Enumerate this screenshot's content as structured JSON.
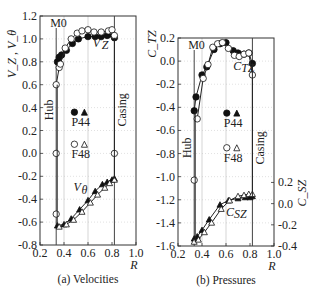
{
  "chart_data": [
    {
      "id": "a",
      "type": "line",
      "caption": "(a) Velocities",
      "xlabel": "R",
      "ylabel": "V_Z , V_θ",
      "xlim": [
        0.2,
        1.0
      ],
      "ylim": [
        -0.8,
        1.2
      ],
      "xticks": [
        "0.2",
        "0.4",
        "0.6",
        "0.8",
        "1.0"
      ],
      "yticks": [
        "-0.8",
        "-0.6",
        "-0.4",
        "-0.2",
        "0.0",
        "0.2",
        "0.4",
        "0.6",
        "0.8",
        "1.0",
        "1.2"
      ],
      "hub_R": 0.335,
      "casing_R": 0.82,
      "grid_x": [
        0.4,
        0.6
      ],
      "annotations": {
        "mode": "M0",
        "hub": "Hub",
        "casing": "Casing",
        "vz_label": "V",
        "vz_sub": "Z",
        "vt_label": "V",
        "vt_sub": "θ"
      },
      "legend": [
        {
          "label": "P44",
          "markers": [
            "filled-circle",
            "filled-triangle"
          ]
        },
        {
          "label": "F48",
          "markers": [
            "open-circle",
            "open-triangle"
          ]
        }
      ],
      "series": [
        {
          "name": "P44 V_Z",
          "marker": "filled-circle",
          "x": [
            0.345,
            0.36,
            0.38,
            0.42,
            0.47,
            0.52,
            0.6,
            0.66,
            0.71,
            0.76,
            0.8,
            0.82
          ],
          "y": [
            0.8,
            0.84,
            0.86,
            0.9,
            0.96,
            1.0,
            1.02,
            1.02,
            1.02,
            1.03,
            1.04,
            1.01
          ]
        },
        {
          "name": "F48 V_Z",
          "marker": "open-circle",
          "x": [
            0.335,
            0.36,
            0.37,
            0.41,
            0.46,
            0.51,
            0.55,
            0.6,
            0.65,
            0.71,
            0.77,
            0.8,
            0.82
          ],
          "y": [
            0.6,
            0.75,
            0.78,
            0.92,
            1.0,
            1.05,
            1.07,
            1.08,
            1.06,
            1.06,
            1.07,
            1.08,
            1.03
          ]
        },
        {
          "name": "F48 V_Z hub/casing",
          "marker": "open-circle",
          "x": [
            0.335,
            0.335,
            0.82
          ],
          "y": [
            0.0,
            -0.53,
            0.0
          ]
        },
        {
          "name": "P44 V_θ",
          "marker": "filled-triangle",
          "x": [
            0.345,
            0.4,
            0.46,
            0.53,
            0.6,
            0.66,
            0.72,
            0.76,
            0.8,
            0.82
          ],
          "y": [
            -0.63,
            -0.62,
            -0.57,
            -0.49,
            -0.41,
            -0.33,
            -0.27,
            -0.25,
            -0.23,
            -0.22
          ]
        },
        {
          "name": "F48 V_θ",
          "marker": "open-triangle",
          "x": [
            0.36,
            0.42,
            0.48,
            0.55,
            0.62,
            0.68,
            0.74,
            0.78,
            0.82
          ],
          "y": [
            -0.64,
            -0.62,
            -0.58,
            -0.51,
            -0.43,
            -0.36,
            -0.3,
            -0.26,
            -0.23
          ]
        }
      ]
    },
    {
      "id": "b",
      "type": "line",
      "caption": "(b) Pressures",
      "xlabel": "R",
      "ylabel": "C_TZ",
      "ylabel_right": "C_SZ",
      "xlim": [
        0.2,
        1.0
      ],
      "ylim": [
        -1.6,
        0.2
      ],
      "ylim_right": [
        -0.4,
        0.2
      ],
      "xticks": [
        "0.2",
        "0.4",
        "0.6",
        "0.8",
        "1.0"
      ],
      "yticks": [
        "-1.6",
        "-1.4",
        "-1.2",
        "-1.0",
        "-0.8",
        "-0.6",
        "-0.4",
        "-0.2",
        "0.0",
        "0.2"
      ],
      "yticks_right": [
        "-0.4",
        "-0.2",
        "0.0",
        "0.2"
      ],
      "hub_R": 0.335,
      "casing_R": 0.82,
      "grid_x": [
        0.4,
        0.6
      ],
      "annotations": {
        "mode": "M0",
        "hub": "Hub",
        "casing": "Casing",
        "ctz_label": "C",
        "ctz_sub": "TZ",
        "csz_label": "C",
        "csz_sub": "SZ"
      },
      "legend": [
        {
          "label": "P44",
          "markers": [
            "filled-circle",
            "filled-triangle"
          ]
        },
        {
          "label": "F48",
          "markers": [
            "open-circle",
            "open-triangle"
          ]
        }
      ],
      "series": [
        {
          "name": "P44 C_TZ",
          "marker": "filled-circle",
          "x": [
            0.335,
            0.35,
            0.4,
            0.44,
            0.5,
            0.55,
            0.6,
            0.66,
            0.7,
            0.75,
            0.79,
            0.82
          ],
          "y": [
            -0.43,
            -0.31,
            -0.12,
            -0.05,
            0.1,
            0.15,
            0.16,
            0.09,
            0.07,
            0.06,
            0.07,
            -0.02
          ]
        },
        {
          "name": "F48 C_TZ",
          "marker": "open-circle",
          "x": [
            0.36,
            0.41,
            0.45,
            0.49,
            0.53,
            0.57,
            0.62,
            0.67,
            0.71,
            0.75,
            0.79,
            0.82
          ],
          "y": [
            -0.5,
            -0.15,
            -0.03,
            0.12,
            0.15,
            0.16,
            0.11,
            0.05,
            0.04,
            0.06,
            0.07,
            -0.12
          ]
        },
        {
          "name": "F48 C_TZ hub",
          "marker": "open-circle",
          "x": [
            0.335
          ],
          "y": [
            -1.03
          ]
        },
        {
          "name": "P44 C_SZ",
          "marker": "filled-triangle",
          "x": [
            0.335,
            0.36,
            0.4,
            0.46,
            0.55,
            0.62,
            0.7,
            0.76,
            0.8,
            0.82
          ],
          "y": [
            -0.33,
            -0.31,
            -0.25,
            -0.15,
            -0.01,
            0.03,
            0.05,
            0.06,
            0.06,
            0.07
          ]
        },
        {
          "name": "F48 C_SZ",
          "marker": "open-triangle",
          "x": [
            0.335,
            0.37,
            0.42,
            0.48,
            0.56,
            0.63,
            0.7,
            0.75,
            0.79,
            0.82
          ],
          "y": [
            -0.36,
            -0.34,
            -0.27,
            -0.18,
            -0.05,
            0.03,
            0.07,
            0.08,
            0.09,
            0.09
          ]
        }
      ]
    }
  ]
}
